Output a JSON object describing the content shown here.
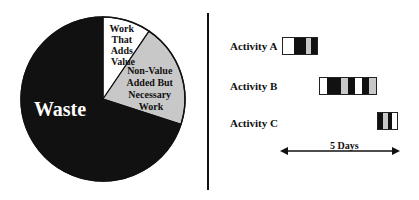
{
  "chart_data": {
    "type": "pie",
    "title": "",
    "slices": [
      {
        "label": "Work That Adds Value",
        "value": 9.5,
        "color": "#ffffff",
        "label_color": "#111111"
      },
      {
        "label": "Non-Value Added But Necessary Work",
        "value": 20.5,
        "color": "#c8c8c8",
        "label_color": "#111111"
      },
      {
        "label": "Waste",
        "value": 70,
        "color": "#111111",
        "label_color": "#ffffff"
      }
    ],
    "start_angle_deg": 0,
    "direction": "clockwise"
  },
  "pie": {
    "labels": {
      "value_add": [
        "Work",
        "That",
        "Adds",
        "Value"
      ],
      "nva": [
        "Non-Value",
        "Added But",
        "Necessary",
        "Work"
      ],
      "waste": "Waste"
    }
  },
  "timeline": {
    "activities": [
      {
        "label": "Activity A",
        "segments": [
          "w",
          "w",
          "b",
          "b",
          "g",
          "b"
        ]
      },
      {
        "label": "Activity B",
        "segments": [
          "w",
          "b",
          "b",
          "g",
          "b",
          "w",
          "b",
          "g"
        ]
      },
      {
        "label": "Activity C",
        "segments": [
          "b",
          "g",
          "b",
          "w"
        ]
      }
    ],
    "span_label": "5 Days"
  }
}
